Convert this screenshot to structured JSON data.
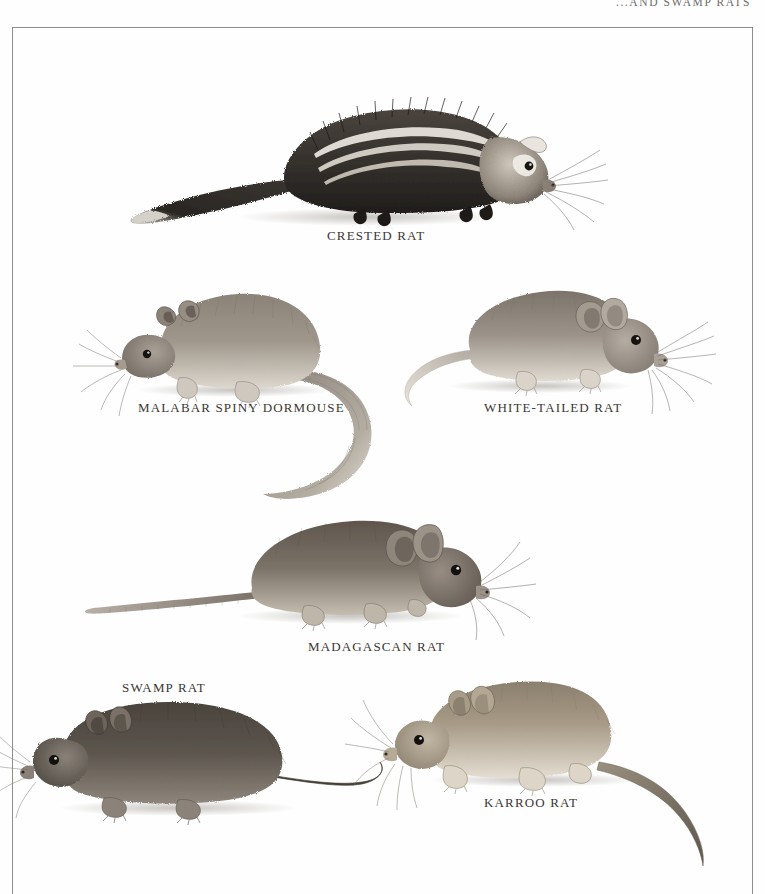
{
  "page": {
    "running_head": "...AND SWAMP RATS",
    "background_color": "#fefefe",
    "frame_color": "#8e8d8b",
    "caption_color": "#3a3734",
    "type": "illustrated-book-plate"
  },
  "plates": [
    {
      "id": "crested-rat",
      "caption": "CRESTED RAT",
      "caption_x": 327,
      "caption_y": 228,
      "facing": "right",
      "description": "dark shaggy rat with white lateral crest stripes and bushy tail",
      "body_color": "#3b3733",
      "belly_color": "#6e6660",
      "stripe_color": "#ebe7e0"
    },
    {
      "id": "malabar-spiny-dormouse",
      "caption": "MALABAR SPINY DORMOUSE",
      "caption_x": 138,
      "caption_y": 400,
      "facing": "left",
      "description": "grey-brown dormouse with long curving bushy tail",
      "body_color": "#7d756c",
      "belly_color": "#d8d2c9",
      "stripe_color": "#b9b2a8"
    },
    {
      "id": "white-tailed-rat",
      "caption": "WHITE-TAILED RAT",
      "caption_x": 484,
      "caption_y": 400,
      "facing": "right",
      "description": "pale grey rat with large ears, long whiskers and a white tail",
      "body_color": "#8c857c",
      "belly_color": "#ddd8d0",
      "stripe_color": "#bdb6ac"
    },
    {
      "id": "madagascan-rat",
      "caption": "MADAGASCAN RAT",
      "caption_x": 308,
      "caption_y": 639,
      "facing": "right",
      "description": "brown rat with very long scaly tail and large rounded ears",
      "body_color": "#6b6158",
      "belly_color": "#bdb4a9",
      "stripe_color": "#968c80"
    },
    {
      "id": "swamp-rat",
      "caption": "SWAMP RAT",
      "caption_x": 122,
      "caption_y": 680,
      "facing": "left",
      "description": "stocky dark brown rat with small ears and thin curving tail",
      "body_color": "#534c45",
      "belly_color": "#8d857b",
      "stripe_color": "#6d655c"
    },
    {
      "id": "karroo-rat",
      "caption": "KARROO RAT",
      "caption_x": 484,
      "caption_y": 795,
      "facing": "left",
      "description": "tan sandy rat with long whiskers and long tapering tail",
      "body_color": "#948877",
      "belly_color": "#e2dbce",
      "stripe_color": "#b5a894"
    }
  ]
}
